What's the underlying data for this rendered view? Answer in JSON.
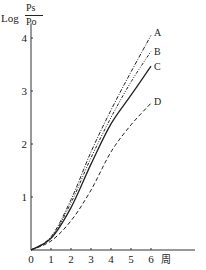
{
  "chart_data": {
    "type": "line",
    "title": "",
    "xlabel": "周",
    "ylabel": "Log Ps/Po",
    "ylabel_parts": {
      "prefix": "Log",
      "numerator": "Ps",
      "denominator": "Po"
    },
    "x_ticks": [
      "0",
      "1",
      "2",
      "3",
      "4",
      "5",
      "6"
    ],
    "y_ticks": [
      "1",
      "2",
      "3",
      "4"
    ],
    "xlim": [
      0,
      8.2
    ],
    "ylim": [
      0,
      4.2
    ],
    "grid": false,
    "legend": "inline labels at line ends",
    "x": [
      0,
      1,
      2,
      3,
      4,
      5,
      6
    ],
    "series": [
      {
        "name": "A",
        "style": "dash-dot",
        "values": [
          0,
          0.25,
          0.95,
          1.85,
          2.64,
          3.36,
          4.05
        ]
      },
      {
        "name": "B",
        "style": "dash-dot-dot",
        "values": [
          0,
          0.23,
          0.89,
          1.74,
          2.5,
          3.17,
          3.75
        ]
      },
      {
        "name": "C",
        "style": "solid",
        "values": [
          0,
          0.22,
          0.8,
          1.62,
          2.38,
          2.92,
          3.47
        ]
      },
      {
        "name": "D",
        "style": "dashed",
        "values": [
          0,
          0.17,
          0.55,
          1.13,
          1.85,
          2.36,
          2.77
        ]
      }
    ]
  }
}
